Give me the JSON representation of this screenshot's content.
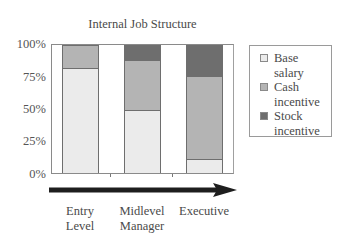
{
  "chart_data": {
    "type": "bar",
    "stacked": true,
    "title": "Internal Job Structure",
    "xlabel": "",
    "ylabel": "",
    "ylim": [
      0,
      100
    ],
    "yticks": [
      "100%",
      "75%",
      "50%",
      "25%",
      "0%"
    ],
    "categories": [
      "Entry Level",
      "Midlevel Manager",
      "Executive"
    ],
    "category_lines": [
      [
        "Entry",
        "Level"
      ],
      [
        "Midlevel",
        "Manager"
      ],
      [
        "Executive",
        ""
      ]
    ],
    "series": [
      {
        "name": "Base salary",
        "legend_lines": [
          "Base",
          "salary"
        ],
        "color": "#ebebeb",
        "values": [
          82,
          49,
          11
        ]
      },
      {
        "name": "Cash incentive",
        "legend_lines": [
          "Cash",
          "incentive"
        ],
        "color": "#b4b4b4",
        "values": [
          18,
          39,
          65
        ]
      },
      {
        "name": "Stock incentive",
        "legend_lines": [
          "Stock",
          "incentive"
        ],
        "color": "#6e6e6e",
        "values": [
          0,
          12,
          24
        ]
      }
    ],
    "legend_position": "right",
    "grid": false,
    "annotations": [
      "Arrow along x-axis pointing right indicating increasing job level"
    ]
  }
}
